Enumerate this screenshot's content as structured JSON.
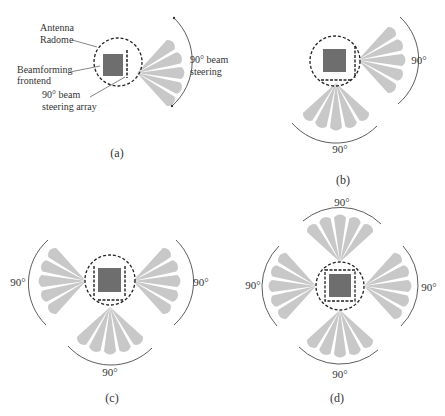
{
  "colors": {
    "beam": "#c8c8c8",
    "chip": "#6e6e6e",
    "radome": "#222222",
    "text": "#333333",
    "arc": "#333333"
  },
  "panels": {
    "a": {
      "caption": "(a)",
      "annotations": {
        "radome_line1": "Antenna",
        "radome_line2": "Radome",
        "frontend_line1": "Beamforming",
        "frontend_line2": "frontend",
        "array_line1": "90° beam",
        "array_line2": "steering array",
        "steer_line1": "90° beam",
        "steer_line2": "steering"
      }
    },
    "b": {
      "caption": "(b)",
      "angle_right": "90°",
      "angle_bottom": "90°"
    },
    "c": {
      "caption": "(c)",
      "angle_left": "90°",
      "angle_right": "90°",
      "angle_bottom": "90°"
    },
    "d": {
      "caption": "(d)",
      "angle_top": "90°",
      "angle_left": "90°",
      "angle_right": "90°",
      "angle_bottom": "90°"
    }
  }
}
